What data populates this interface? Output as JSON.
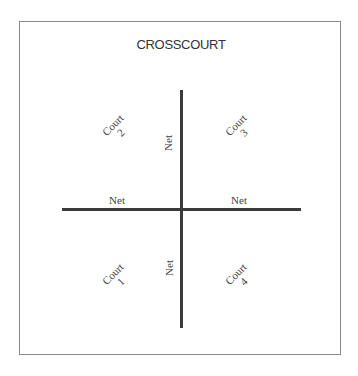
{
  "diagram": {
    "title": "CROSSCOURT",
    "nets": {
      "horizontal_left": "Net",
      "horizontal_right": "Net",
      "vertical_top": "Net",
      "vertical_bottom": "Net"
    },
    "courts": [
      {
        "label": "Court",
        "number": "2",
        "position": "top-left"
      },
      {
        "label": "Court",
        "number": "3",
        "position": "top-right"
      },
      {
        "label": "Court",
        "number": "1",
        "position": "bottom-left"
      },
      {
        "label": "Court",
        "number": "4",
        "position": "bottom-right"
      }
    ]
  }
}
